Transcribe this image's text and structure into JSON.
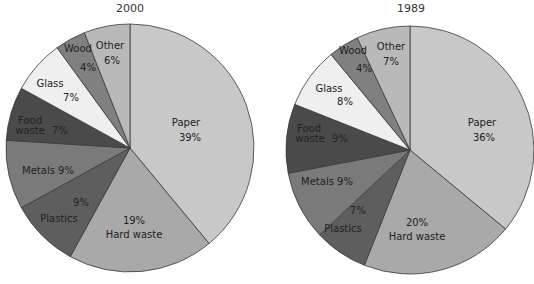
{
  "chart_data": [
    {
      "type": "pie",
      "title": "2000",
      "start_angle": "12 o'clock, clockwise",
      "categories": [
        "Paper",
        "Hard waste",
        "Plastics",
        "Metals",
        "Food waste",
        "Glass",
        "Wood",
        "Other"
      ],
      "values": [
        39,
        19,
        9,
        9,
        7,
        7,
        4,
        6
      ],
      "labels": [
        "Paper 39%",
        "19% Hard waste",
        "9% Plastics",
        "Metals 9%",
        "Food waste 7%",
        "Glass 7%",
        "Wood 4%",
        "Other 6%"
      ],
      "colors": [
        "#c8c8c8",
        "#a9a9a9",
        "#5e5e5e",
        "#7a7a7a",
        "#4a4a4a",
        "#efefef",
        "#808080",
        "#b9b9b9"
      ]
    },
    {
      "type": "pie",
      "title": "1989",
      "start_angle": "12 o'clock, clockwise",
      "categories": [
        "Paper",
        "Hard waste",
        "Plastics",
        "Metals",
        "Food waste",
        "Glass",
        "Wood",
        "Other"
      ],
      "values": [
        36,
        20,
        7,
        9,
        9,
        8,
        4,
        7
      ],
      "labels": [
        "Paper 36%",
        "20% Hard waste",
        "7% Plastics",
        "Metals 9%",
        "Food waste 9%",
        "Glass 8%",
        "Wood 4%",
        "Other 7%"
      ],
      "colors": [
        "#c8c8c8",
        "#a9a9a9",
        "#5e5e5e",
        "#7a7a7a",
        "#4a4a4a",
        "#efefef",
        "#808080",
        "#b9b9b9"
      ]
    }
  ],
  "charts": {
    "left": {
      "title": "2000",
      "labels": {
        "paper_name": "Paper",
        "paper_pct": "39%",
        "hard_pct": "19%",
        "hard_name": "Hard waste",
        "plastics_pct": "9%",
        "plastics_name": "Plastics",
        "metals": "Metals  9%",
        "food_name1": "Food",
        "food_name2": "waste",
        "food_pct": "7%",
        "glass_name": "Glass",
        "glass_pct": "7%",
        "wood_name": "Wood",
        "wood_pct": "4%",
        "other_name": "Other",
        "other_pct": "6%"
      }
    },
    "right": {
      "title": "1989",
      "labels": {
        "paper_name": "Paper",
        "paper_pct": "36%",
        "hard_pct": "20%",
        "hard_name": "Hard waste",
        "plastics_pct": "7%",
        "plastics_name": "Plastics",
        "metals": "Metals 9%",
        "food_name1": "Food",
        "food_name2": "waste",
        "food_pct": "9%",
        "glass_name": "Glass",
        "glass_pct": "8%",
        "wood_name": "Wood",
        "wood_pct": "4%",
        "other_name": "Other",
        "other_pct": "7%"
      }
    }
  }
}
